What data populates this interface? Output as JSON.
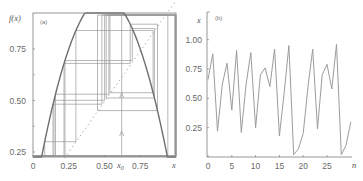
{
  "figure": {
    "panels": [
      {
        "id": "a",
        "label": "(a)"
      },
      {
        "id": "b",
        "label": "(b)"
      }
    ]
  },
  "colors": {
    "curve": "#6e6e6e",
    "cobweb": "#9a9a9a",
    "diagonal": "#b0b0b0",
    "axis": "#8a8a8a",
    "series": "#9c9c9c"
  },
  "chart_data": [
    {
      "panel": "(a)",
      "type": "line",
      "title": "",
      "xlabel": "x",
      "ylabel": "f(x)",
      "x_ticks": [
        "0",
        "0.25",
        "0.50",
        "0.75"
      ],
      "x_special_label": "x0",
      "y_ticks": [
        "0.25",
        "0.50",
        "0.75"
      ],
      "xlim": [
        0,
        1
      ],
      "ylim": [
        0.2,
        1
      ],
      "grid": false,
      "series": [
        {
          "name": "f(x) = 4x(1-x)",
          "kind": "parabola",
          "x": [
            0,
            0.1,
            0.2,
            0.3,
            0.4,
            0.5,
            0.6,
            0.7,
            0.8,
            0.9,
            1.0
          ],
          "values": [
            0,
            0.36,
            0.64,
            0.84,
            0.96,
            1.0,
            0.96,
            0.84,
            0.64,
            0.36,
            0
          ]
        },
        {
          "name": "diagonal y = x",
          "kind": "dashed",
          "x": [
            0,
            1
          ],
          "values": [
            0,
            1
          ]
        },
        {
          "name": "cobweb iterations",
          "kind": "steps",
          "start_x0": 0.62
        }
      ],
      "legend": "none"
    },
    {
      "panel": "(b)",
      "type": "line",
      "title": "",
      "xlabel": "n",
      "ylabel": "x",
      "x_ticks": [
        "0",
        "5",
        "10",
        "15",
        "20",
        "25"
      ],
      "y_ticks": [
        "0.25",
        "0.50",
        "0.75",
        "1.00"
      ],
      "xlim": [
        0,
        30
      ],
      "ylim": [
        0,
        1.05
      ],
      "grid": false,
      "series": [
        {
          "name": "x_n",
          "x": [
            0,
            1,
            2,
            3,
            4,
            5,
            6,
            7,
            8,
            9,
            10,
            11,
            12,
            13,
            14,
            15,
            16,
            17,
            18,
            19,
            20,
            21,
            22,
            23,
            24,
            25,
            26,
            27,
            28,
            29,
            30
          ],
          "values": [
            0.66,
            0.88,
            0.22,
            0.62,
            0.8,
            0.4,
            0.91,
            0.21,
            0.62,
            0.89,
            0.25,
            0.7,
            0.76,
            0.6,
            0.92,
            0.18,
            0.55,
            0.95,
            0.02,
            0.07,
            0.2,
            0.6,
            0.92,
            0.24,
            0.7,
            0.79,
            0.58,
            0.96,
            0.02,
            0.1,
            0.3
          ]
        }
      ],
      "legend": "none"
    }
  ]
}
